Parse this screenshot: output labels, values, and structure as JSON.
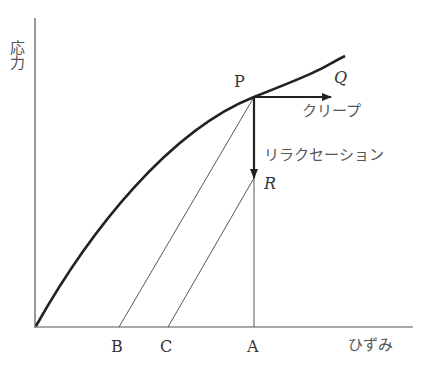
{
  "diagram": {
    "title": "",
    "y_axis_label": "応力",
    "x_axis_label": "ひずみ",
    "points": {
      "P": "P",
      "Q": "Q",
      "R": "R",
      "A": "A",
      "B": "B",
      "C": "C"
    },
    "annotations": {
      "creep": "クリープ",
      "relaxation": "リラクセーション"
    },
    "colors": {
      "line": "#222222",
      "text": "#333333"
    }
  }
}
